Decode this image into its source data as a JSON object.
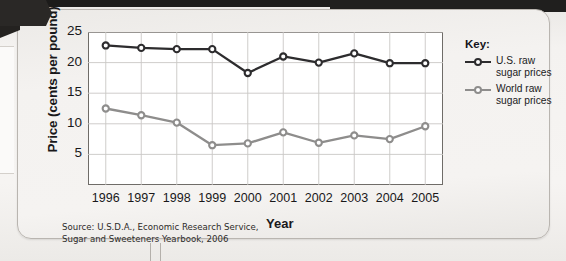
{
  "figure": {
    "source_note_line1": "Source: U.S.D.A., Economic Research Service,",
    "source_note_line2": "Sugar and Sweeteners Yearbook, 2006"
  },
  "legend": {
    "title": "Key:",
    "entries": [
      {
        "label_line1": "U.S. raw",
        "label_line2": "sugar prices",
        "color": "#2d2c2e"
      },
      {
        "label_line1": "World raw",
        "label_line2": "sugar prices",
        "color": "#8e8d8c"
      }
    ]
  },
  "chart_data": {
    "type": "line",
    "title": "",
    "xlabel": "Year",
    "ylabel": "Price (cents per pound)",
    "categories": [
      "1996",
      "1997",
      "1998",
      "1999",
      "2000",
      "2001",
      "2002",
      "2003",
      "2004",
      "2005"
    ],
    "x": [
      1996,
      1997,
      1998,
      1999,
      2000,
      2001,
      2002,
      2003,
      2004,
      2005
    ],
    "xlim": [
      1995.5,
      2005.5
    ],
    "ylim": [
      0,
      25
    ],
    "yticks": [
      5,
      10,
      15,
      20,
      25
    ],
    "ytick_labels": [
      "5",
      "10",
      "15",
      "20",
      "25"
    ],
    "grid": true,
    "legend_position": "right",
    "series": [
      {
        "name": "U.S. raw sugar prices",
        "color": "#2d2c2e",
        "marker": "circle-open",
        "values": [
          22.8,
          22.4,
          22.2,
          22.2,
          18.3,
          21.0,
          20.0,
          21.5,
          19.9,
          19.9
        ]
      },
      {
        "name": "World raw sugar prices",
        "color": "#8e8d8c",
        "marker": "circle-open",
        "values": [
          12.5,
          11.4,
          10.2,
          6.5,
          6.8,
          8.6,
          6.9,
          8.1,
          7.5,
          9.6
        ]
      }
    ]
  }
}
